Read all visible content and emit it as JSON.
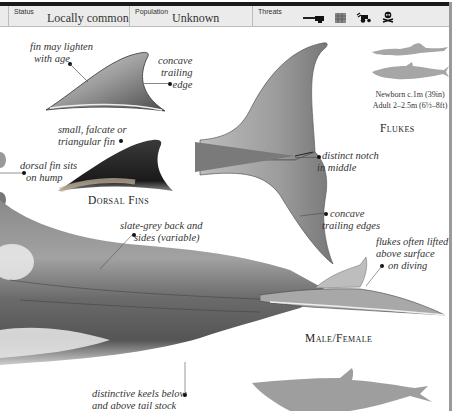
{
  "infobar": {
    "status_label": "Status",
    "status_value": "Locally common",
    "population_label": "Population",
    "population_value": "Unknown",
    "threats_label": "Threats",
    "threat_icons": [
      "gun-icon",
      "net-icon",
      "tractor-pollution-icon",
      "skull-crossbones-icon"
    ]
  },
  "dorsal_fins": {
    "heading": "Dorsal Fins",
    "captions": {
      "lighten": [
        "fin may lighten",
        "with age"
      ],
      "concave": [
        "concave",
        "trailing",
        "edge"
      ],
      "shape": [
        "small, falcate or",
        "triangular fin"
      ],
      "hump": [
        "dorsal fin sits",
        "on hump"
      ]
    }
  },
  "flukes": {
    "heading": "Flukes",
    "captions": {
      "notch": [
        "distinct notch",
        "in middle"
      ],
      "edges": [
        "concave",
        "trailing edges"
      ]
    }
  },
  "size": {
    "newborn": "Newborn c.1m (39in)",
    "adult": "Adult 2–2.5m (6½–8ft)"
  },
  "body": {
    "heading": "Male/Female",
    "captions": {
      "back": [
        "slate-grey back and",
        "sides (variable)"
      ],
      "flukes_lifted": [
        "flukes often lifted",
        "above surface",
        "on diving"
      ],
      "keels": [
        "distinctive keels below",
        "and above tail stock"
      ]
    }
  },
  "colors": {
    "bar": "#1a1a1a",
    "infobar_bg": "#ebebeb",
    "silhouette": "#9e9e9e",
    "body_grey": "#6e6e6e"
  }
}
